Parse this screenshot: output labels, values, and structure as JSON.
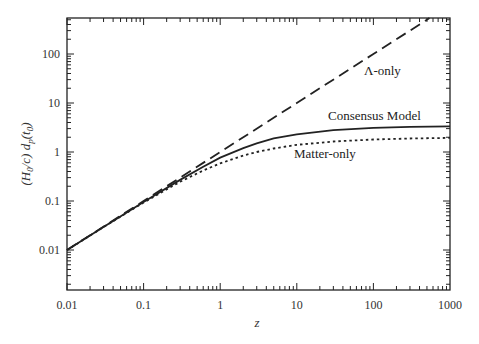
{
  "chart_data": {
    "type": "line",
    "title": "",
    "xlabel": "z",
    "ylabel": "(H0/c) dp(t0)",
    "xscale": "log",
    "yscale": "log",
    "xlim": [
      0.01,
      1000
    ],
    "ylim": [
      0.0015,
      540
    ],
    "xticks": [
      "0.01",
      "0.1",
      "1",
      "10",
      "100",
      "1000"
    ],
    "yticks": [
      "0.01",
      "0.1",
      "1",
      "10",
      "100"
    ],
    "grid": false,
    "legend": "inline labels",
    "series": [
      {
        "name": "Λ-only",
        "style": "dashed",
        "x": [
          0.01,
          0.1,
          1,
          10,
          100,
          540
        ],
        "values": [
          0.01,
          0.1,
          1,
          10,
          100,
          540
        ]
      },
      {
        "name": "Consensus Model",
        "style": "solid",
        "x": [
          0.01,
          0.03,
          0.1,
          0.3,
          0.6,
          1,
          2,
          3,
          5,
          10,
          30,
          100,
          300,
          1000
        ],
        "values": [
          0.00995,
          0.0295,
          0.096,
          0.27,
          0.5,
          0.77,
          1.2,
          1.5,
          1.9,
          2.3,
          2.8,
          3.1,
          3.25,
          3.35
        ]
      },
      {
        "name": "Matter-only",
        "style": "dotted",
        "x": [
          0.01,
          0.03,
          0.1,
          0.3,
          0.6,
          1,
          2,
          3,
          5,
          10,
          30,
          100,
          300,
          1000
        ],
        "values": [
          0.00995,
          0.0293,
          0.093,
          0.246,
          0.419,
          0.586,
          0.845,
          1.0,
          1.18,
          1.4,
          1.64,
          1.8,
          1.885,
          1.937
        ]
      }
    ],
    "annotations": [
      {
        "text": "Λ-only",
        "x": 100,
        "y": 20
      },
      {
        "text": "Consensus Model",
        "x": 60,
        "y": 4.2
      },
      {
        "text": "Matter-only",
        "x": 25,
        "y": 1.3
      }
    ]
  }
}
